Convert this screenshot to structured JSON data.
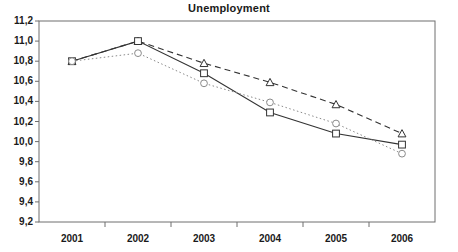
{
  "chart_data": {
    "type": "line",
    "title": "Unemployment",
    "xlabel": "",
    "ylabel": "",
    "categories": [
      "2001",
      "2002",
      "2003",
      "2004",
      "2005",
      "2006"
    ],
    "ylim": [
      9.2,
      11.2
    ],
    "ytick_labels": [
      "11,2",
      "11,0",
      "10,8",
      "10,6",
      "10,4",
      "10,2",
      "10,0",
      "9,8",
      "9,6",
      "9,4",
      "9,2"
    ],
    "ytick_values": [
      11.2,
      11.0,
      10.8,
      10.6,
      10.4,
      10.2,
      10.0,
      9.8,
      9.6,
      9.4,
      9.2
    ],
    "grid": false,
    "legend": "none",
    "decimal_separator": ",",
    "series": [
      {
        "name": "series-triangle-dashed",
        "marker": "triangle",
        "line_style": "dashed",
        "color": "#333333",
        "values": [
          10.8,
          11.0,
          10.78,
          10.59,
          10.37,
          10.08
        ]
      },
      {
        "name": "series-square-solid",
        "marker": "square",
        "line_style": "solid",
        "color": "#333333",
        "values": [
          10.8,
          11.0,
          10.68,
          10.29,
          10.08,
          9.97
        ]
      },
      {
        "name": "series-circle-dotted",
        "marker": "circle",
        "line_style": "dotted",
        "color": "#8a8a8a",
        "values": [
          10.8,
          10.88,
          10.58,
          10.39,
          10.18,
          9.88
        ]
      }
    ]
  },
  "axis": {
    "frame_color": "#6e6e6e",
    "tick_color": "#6e6e6e"
  }
}
